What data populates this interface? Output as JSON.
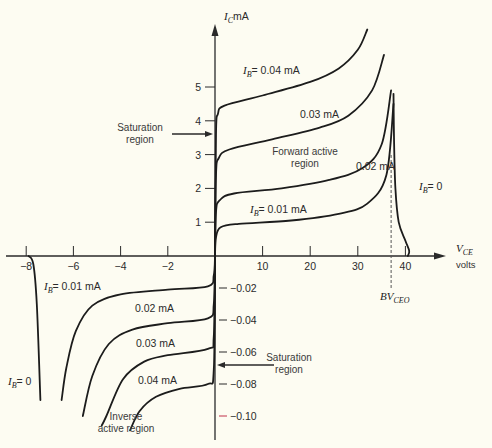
{
  "chart_data": {
    "type": "line",
    "xlabel": "V_CE volts",
    "ylabel": "I_C mA",
    "x_axis": {
      "symbol": "V",
      "subscript": "CE",
      "unit": "volts",
      "positive_ticks": [
        10,
        20,
        30,
        40
      ],
      "negative_ticks": [
        -2,
        -4,
        -6,
        -8
      ],
      "positive_range": [
        0,
        45
      ],
      "negative_range": [
        -8.5,
        0
      ]
    },
    "y_axis": {
      "symbol": "I",
      "subscript": "C",
      "unit": "mA",
      "positive_ticks": [
        1,
        2,
        3,
        4,
        5
      ],
      "negative_ticks": [
        -0.02,
        -0.04,
        -0.06,
        -0.08,
        -0.1
      ],
      "negative_tick_labels": [
        "−0.02",
        "−0.04",
        "−0.06",
        "−0.08",
        "−0.10"
      ],
      "positive_range": [
        0,
        6.3
      ],
      "negative_range": [
        -0.12,
        0
      ]
    },
    "forward_series": [
      {
        "name": "I_B = 0.04 mA",
        "label": "= 0.04 mA",
        "show_ib_prefix": true,
        "points": [
          [
            0,
            0
          ],
          [
            0.2,
            3.6
          ],
          [
            0.6,
            4.2
          ],
          [
            2,
            4.45
          ],
          [
            10,
            4.75
          ],
          [
            20,
            5.15
          ],
          [
            26,
            5.55
          ],
          [
            30,
            6.1
          ],
          [
            32,
            6.7
          ]
        ]
      },
      {
        "name": "I_B = 0.03 mA",
        "label": "0.03 mA",
        "show_ib_prefix": false,
        "points": [
          [
            0,
            0
          ],
          [
            0.2,
            2.4
          ],
          [
            0.8,
            2.9
          ],
          [
            3,
            3.15
          ],
          [
            12,
            3.45
          ],
          [
            22,
            3.8
          ],
          [
            28,
            4.15
          ],
          [
            33,
            4.9
          ],
          [
            35.5,
            5.95
          ]
        ]
      },
      {
        "name": "I_B = 0.02 mA",
        "label": "0.02 mA",
        "show_ib_prefix": false,
        "points": [
          [
            0,
            0
          ],
          [
            0.2,
            1.3
          ],
          [
            1,
            1.65
          ],
          [
            4,
            1.85
          ],
          [
            14,
            2.0
          ],
          [
            24,
            2.25
          ],
          [
            31,
            2.6
          ],
          [
            35,
            3.3
          ],
          [
            37,
            4.9
          ]
        ]
      },
      {
        "name": "I_B = 0.01 mA",
        "label": "= 0.01 mA",
        "show_ib_prefix": true,
        "points": [
          [
            0,
            0
          ],
          [
            0.2,
            0.55
          ],
          [
            1.2,
            0.85
          ],
          [
            5,
            0.95
          ],
          [
            16,
            1.05
          ],
          [
            26,
            1.25
          ],
          [
            32,
            1.55
          ],
          [
            36,
            2.4
          ],
          [
            37.5,
            4.5
          ]
        ]
      },
      {
        "name": "I_B = 0",
        "label": "= 0",
        "show_ib_prefix": true,
        "points": [
          [
            37.5,
            4.8
          ],
          [
            37.6,
            3.5
          ],
          [
            37.9,
            2.0
          ],
          [
            38.6,
            1.0
          ],
          [
            40,
            0.45
          ],
          [
            40.8,
            0.15
          ],
          [
            40.5,
            0
          ]
        ]
      }
    ],
    "inverse_series": [
      {
        "name": "I_B = 0.01 mA",
        "label": "= 0.01 mA",
        "show_ib_prefix": true,
        "points": [
          [
            0,
            0
          ],
          [
            -0.05,
            -0.012
          ],
          [
            -0.3,
            -0.019
          ],
          [
            -2,
            -0.021
          ],
          [
            -4,
            -0.024
          ],
          [
            -5.2,
            -0.031
          ],
          [
            -5.9,
            -0.047
          ],
          [
            -6.3,
            -0.07
          ],
          [
            -6.5,
            -0.09
          ]
        ]
      },
      {
        "name": "I_B = 0.02 mA",
        "label": "0.02 mA",
        "show_ib_prefix": false,
        "points": [
          [
            0,
            0
          ],
          [
            -0.05,
            -0.03
          ],
          [
            -0.3,
            -0.039
          ],
          [
            -2,
            -0.042
          ],
          [
            -3.5,
            -0.046
          ],
          [
            -4.5,
            -0.055
          ],
          [
            -5.2,
            -0.075
          ],
          [
            -5.6,
            -0.1
          ]
        ]
      },
      {
        "name": "I_B = 0.03 mA",
        "label": "0.03 mA",
        "show_ib_prefix": false,
        "points": [
          [
            0,
            0
          ],
          [
            -0.05,
            -0.05
          ],
          [
            -0.3,
            -0.058
          ],
          [
            -2,
            -0.062
          ],
          [
            -3,
            -0.066
          ],
          [
            -3.9,
            -0.077
          ],
          [
            -4.6,
            -0.1
          ],
          [
            -4.8,
            -0.106
          ]
        ]
      },
      {
        "name": "I_B = 0.04 mA",
        "label": "0.04 mA",
        "show_ib_prefix": false,
        "points": [
          [
            0,
            0
          ],
          [
            -0.05,
            -0.071
          ],
          [
            -0.3,
            -0.08
          ],
          [
            -1.5,
            -0.083
          ],
          [
            -2.5,
            -0.088
          ],
          [
            -3.2,
            -0.097
          ],
          [
            -3.6,
            -0.109
          ]
        ]
      },
      {
        "name": "I_B = 0",
        "label": "= 0",
        "show_ib_prefix": true,
        "points": [
          [
            -7.9,
            0
          ],
          [
            -7.7,
            -0.005
          ],
          [
            -7.55,
            -0.03
          ],
          [
            -7.4,
            -0.09
          ]
        ]
      }
    ],
    "reference_lines": [
      {
        "type": "vertical-dashed",
        "x": 37,
        "label": "BV",
        "label_subscript": "CEO"
      }
    ],
    "annotations": [
      {
        "text_lines": [
          "Saturation",
          "region"
        ],
        "arrow_to": "forward-saturation",
        "at_y": 3.6
      },
      {
        "text_lines": [
          "Forward active",
          "region"
        ]
      },
      {
        "text_lines": [
          "Saturation",
          "region"
        ],
        "arrow_to": "inverse-saturation",
        "at_y": -0.071
      },
      {
        "text_lines": [
          "Inverse",
          "active region"
        ]
      }
    ]
  },
  "labels": {
    "ib_symbol": "I",
    "ib_sub": "B",
    "ic_unit": "mA",
    "vce_unit": "volts",
    "bv": "BV",
    "bv_sub": "CEO",
    "sat_fwd_1": "Saturation",
    "sat_fwd_2": "region",
    "fwd_active_1": "Forward active",
    "fwd_active_2": "region",
    "sat_inv_1": "Saturation",
    "sat_inv_2": "region",
    "inv_active_1": "Inverse",
    "inv_active_2": "active region"
  }
}
